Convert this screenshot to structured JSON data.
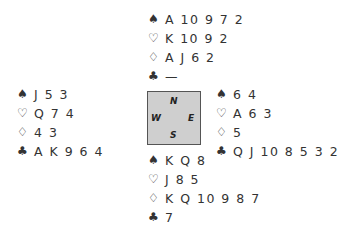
{
  "hands": {
    "north": {
      "spades": "A 10 9 7 2",
      "hearts": "K 10 9 2",
      "diamonds": "A J 6 2",
      "clubs": "—"
    },
    "west": {
      "spades": "J 5 3",
      "hearts": "Q 7 4",
      "diamonds": "4 3",
      "clubs": "A K 9 6 4"
    },
    "east": {
      "spades": "6 4",
      "hearts": "A 6 3",
      "diamonds": "5",
      "clubs": "Q J 10 8 5 3 2"
    },
    "south": {
      "spades": "K Q 8",
      "hearts": "J 8 5",
      "diamonds": "K Q 10 9 8 7",
      "clubs": "7"
    }
  },
  "suits": {
    "spades": "♠",
    "hearts": "♡",
    "diamonds": "♢",
    "clubs": "♣"
  },
  "compass": {
    "n": "N",
    "s": "S",
    "e": "E",
    "w": "W"
  }
}
